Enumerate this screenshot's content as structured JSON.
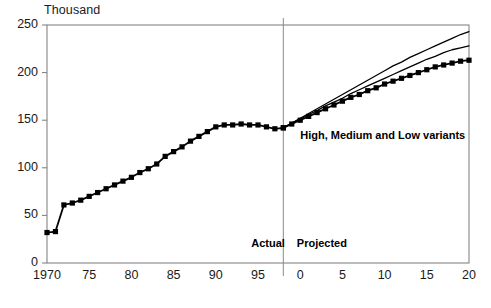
{
  "chart_data": {
    "type": "line",
    "title": "",
    "subtitle": "",
    "unit_label": "Thousand",
    "xlabel": "",
    "ylabel": "",
    "ylim": [
      0,
      250
    ],
    "ytick_values": [
      0,
      50,
      100,
      150,
      200,
      250
    ],
    "ytick_labels": [
      "0",
      "50",
      "100",
      "150",
      "200",
      "250"
    ],
    "xlim": [
      1970,
      2020
    ],
    "xtick_values": [
      1970,
      1975,
      1980,
      1985,
      1990,
      1995,
      2000,
      2005,
      2010,
      2015,
      2020
    ],
    "xtick_labels": [
      "1970",
      "75",
      "80",
      "85",
      "90",
      "95",
      "0",
      "5",
      "10",
      "15",
      "20"
    ],
    "grid": false,
    "legend": "none",
    "annotations": [
      {
        "name": "variants-label",
        "text": "High, Medium and Low variants",
        "x": 2000,
        "y": 133
      },
      {
        "name": "actual-label",
        "text": "Actual",
        "x": 1994.2,
        "y": 20
      },
      {
        "name": "projected-label",
        "text": "Projected",
        "x": 1999.6,
        "y": 20
      }
    ],
    "divider": {
      "name": "actual-projected-divider",
      "x": 1998,
      "label": "projection start"
    },
    "series": [
      {
        "name": "Actual",
        "style": "line-with-square-markers",
        "color": "#000000",
        "x": [
          1970,
          1971,
          1972,
          1973,
          1974,
          1975,
          1976,
          1977,
          1978,
          1979,
          1980,
          1981,
          1982,
          1983,
          1984,
          1985,
          1986,
          1987,
          1988,
          1989,
          1990,
          1991,
          1992,
          1993,
          1994,
          1995,
          1996,
          1997,
          1998
        ],
        "values": [
          32,
          33,
          61,
          63,
          66,
          70,
          74,
          78,
          82,
          86,
          90,
          95,
          99,
          104,
          112,
          117,
          122,
          128,
          133,
          138,
          143,
          145,
          145,
          146,
          145,
          145,
          143,
          141,
          142
        ]
      },
      {
        "name": "High variant",
        "style": "line",
        "color": "#000000",
        "x": [
          1998,
          1999,
          2000,
          2001,
          2002,
          2003,
          2004,
          2005,
          2006,
          2007,
          2008,
          2009,
          2010,
          2011,
          2012,
          2013,
          2014,
          2015,
          2016,
          2017,
          2018,
          2019,
          2020
        ],
        "values": [
          142,
          147,
          152,
          157,
          162,
          167,
          172,
          177,
          182,
          187,
          192,
          197,
          202,
          207,
          211,
          216,
          220,
          224,
          228,
          232,
          236,
          240,
          243
        ]
      },
      {
        "name": "Medium variant",
        "style": "line",
        "color": "#000000",
        "x": [
          1998,
          1999,
          2000,
          2001,
          2002,
          2003,
          2004,
          2005,
          2006,
          2007,
          2008,
          2009,
          2010,
          2011,
          2012,
          2013,
          2014,
          2015,
          2016,
          2017,
          2018,
          2019,
          2020
        ],
        "values": [
          142,
          147,
          151,
          156,
          160,
          165,
          169,
          173,
          178,
          182,
          186,
          190,
          194,
          198,
          202,
          206,
          210,
          214,
          217,
          221,
          224,
          226,
          228
        ]
      },
      {
        "name": "Low variant",
        "style": "line-with-square-markers",
        "color": "#000000",
        "x": [
          1998,
          1999,
          2000,
          2001,
          2002,
          2003,
          2004,
          2005,
          2006,
          2007,
          2008,
          2009,
          2010,
          2011,
          2012,
          2013,
          2014,
          2015,
          2016,
          2017,
          2018,
          2019,
          2020
        ],
        "values": [
          142,
          146,
          150,
          154,
          158,
          162,
          166,
          170,
          174,
          177,
          181,
          184,
          188,
          191,
          194,
          197,
          200,
          203,
          206,
          208,
          210,
          212,
          213
        ]
      }
    ]
  }
}
